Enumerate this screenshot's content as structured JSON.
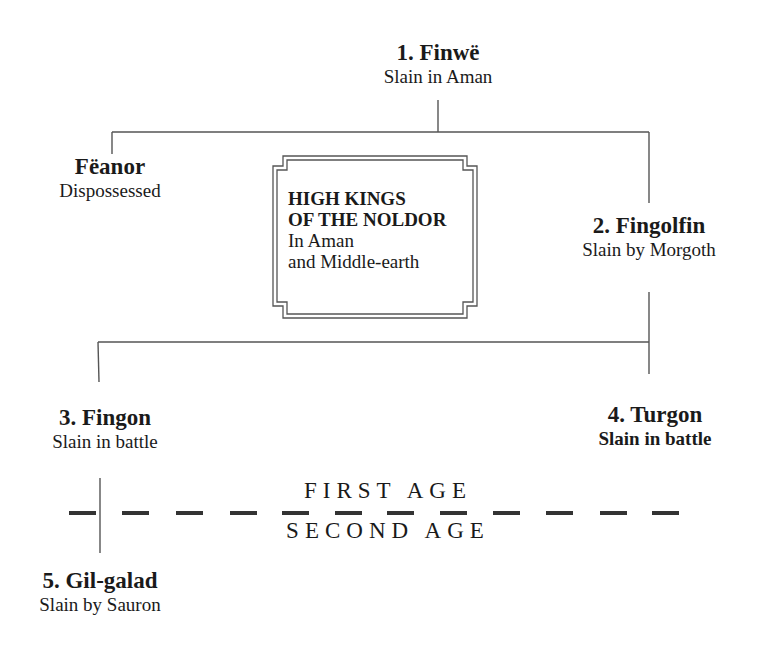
{
  "chart_title_box": {
    "title_line1": "HIGH KINGS",
    "title_line2": "OF THE NOLDOR",
    "subtitle_line1": "In Aman",
    "subtitle_line2": "and Middle-earth"
  },
  "nodes": [
    {
      "name": "1. Finwë",
      "fate": "Slain in Aman"
    },
    {
      "name": "Fëanor",
      "fate": "Dispossessed"
    },
    {
      "name": "2. Fingolfin",
      "fate": "Slain by Morgoth"
    },
    {
      "name": "3. Fingon",
      "fate": "Slain in battle"
    },
    {
      "name": "4. Turgon",
      "fate": "Slain in battle"
    },
    {
      "name": "5. Gil-galad",
      "fate": "Slain by Sauron"
    }
  ],
  "age_divider": {
    "above": "FIRST AGE",
    "below": "SECOND AGE"
  },
  "colors": {
    "line": "#555555",
    "text": "#1a1a1a",
    "background": "#ffffff"
  }
}
